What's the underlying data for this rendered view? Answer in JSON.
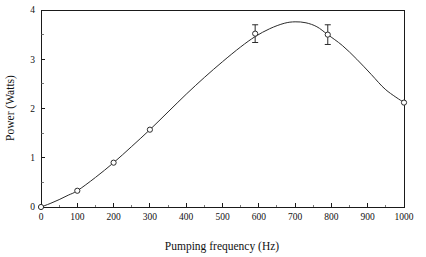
{
  "chart_data": {
    "type": "line",
    "title": "",
    "subtitle": "",
    "xlabel": "Pumping frequency (Hz)",
    "ylabel": "Power (Watts)",
    "xlim": [
      0,
      1000
    ],
    "ylim": [
      0,
      4
    ],
    "grid": false,
    "legend": null,
    "legend_position": "none",
    "marker": "open-circle",
    "line_color": "#2b2b2b",
    "marker_fill": "#ffffff",
    "background": "#ffffff",
    "frame": true,
    "x_ticks": [
      0,
      100,
      200,
      300,
      400,
      500,
      600,
      700,
      800,
      900,
      1000
    ],
    "x_tick_labels": [
      "0",
      "100",
      "200",
      "300",
      "400",
      "500",
      "600",
      "700",
      "800",
      "900",
      "1000"
    ],
    "x_minor_ticks": [
      50,
      150,
      250,
      350,
      450,
      550,
      650,
      750,
      850,
      950
    ],
    "y_ticks": [
      0,
      1,
      2,
      3,
      4
    ],
    "y_tick_labels": [
      "0",
      "1",
      "2",
      "3",
      "4"
    ],
    "y_minor_ticks": [
      0.5,
      1.5,
      2.5,
      3.5
    ],
    "x": [
      0,
      100,
      200,
      300,
      590,
      790,
      1000
    ],
    "values": [
      0.0,
      0.33,
      0.9,
      1.57,
      3.52,
      3.5,
      2.12
    ],
    "errors": [
      null,
      null,
      null,
      null,
      0.18,
      0.2,
      null
    ],
    "curve": [
      [
        0,
        0.0
      ],
      [
        25,
        0.07
      ],
      [
        50,
        0.15
      ],
      [
        75,
        0.24
      ],
      [
        100,
        0.33
      ],
      [
        150,
        0.6
      ],
      [
        200,
        0.9
      ],
      [
        250,
        1.23
      ],
      [
        300,
        1.57
      ],
      [
        350,
        1.93
      ],
      [
        400,
        2.29
      ],
      [
        450,
        2.63
      ],
      [
        500,
        2.95
      ],
      [
        550,
        3.25
      ],
      [
        590,
        3.46
      ],
      [
        630,
        3.62
      ],
      [
        670,
        3.73
      ],
      [
        700,
        3.76
      ],
      [
        730,
        3.74
      ],
      [
        760,
        3.66
      ],
      [
        790,
        3.5
      ],
      [
        830,
        3.28
      ],
      [
        870,
        3.0
      ],
      [
        910,
        2.69
      ],
      [
        950,
        2.38
      ],
      [
        1000,
        2.12
      ]
    ]
  }
}
